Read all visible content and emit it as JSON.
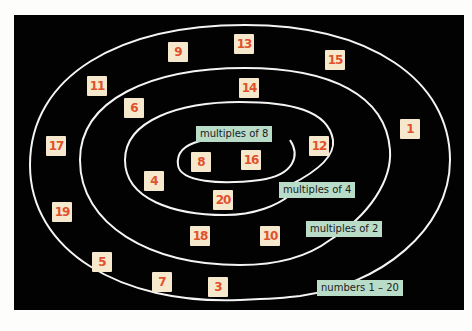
{
  "diagram": {
    "background_color": "#020202",
    "tile_color": "#f6e8cc",
    "number_color": "#e0512c",
    "label_color": "#b9dcc9",
    "sets": [
      {
        "label": "numbers 1 – 20",
        "members_exclusive": [
          "9",
          "13",
          "15",
          "11",
          "1",
          "17",
          "19",
          "5",
          "7",
          "3"
        ]
      },
      {
        "label": "multiples of 2",
        "members_exclusive": [
          "14",
          "6",
          "18",
          "10"
        ]
      },
      {
        "label": "multiples of 4",
        "members_exclusive": [
          "12",
          "4",
          "20"
        ]
      },
      {
        "label": "multiples of 8",
        "members_exclusive": [
          "8",
          "16"
        ]
      }
    ],
    "tiles": [
      {
        "n": "9",
        "x": 168,
        "y": 42
      },
      {
        "n": "13",
        "x": 234,
        "y": 34
      },
      {
        "n": "15",
        "x": 325,
        "y": 50
      },
      {
        "n": "11",
        "x": 87,
        "y": 76
      },
      {
        "n": "14",
        "x": 239,
        "y": 78
      },
      {
        "n": "6",
        "x": 124,
        "y": 98
      },
      {
        "n": "1",
        "x": 400,
        "y": 119
      },
      {
        "n": "17",
        "x": 46,
        "y": 136
      },
      {
        "n": "12",
        "x": 309,
        "y": 136
      },
      {
        "n": "8",
        "x": 191,
        "y": 152
      },
      {
        "n": "16",
        "x": 241,
        "y": 150
      },
      {
        "n": "4",
        "x": 144,
        "y": 171
      },
      {
        "n": "20",
        "x": 213,
        "y": 190
      },
      {
        "n": "19",
        "x": 52,
        "y": 202
      },
      {
        "n": "18",
        "x": 190,
        "y": 226
      },
      {
        "n": "10",
        "x": 260,
        "y": 226
      },
      {
        "n": "5",
        "x": 92,
        "y": 252
      },
      {
        "n": "7",
        "x": 152,
        "y": 272
      },
      {
        "n": "3",
        "x": 208,
        "y": 277
      }
    ],
    "labels": [
      {
        "text": "multiples of 8",
        "x": 196,
        "y": 126
      },
      {
        "text": "multiples of 4",
        "x": 279,
        "y": 182
      },
      {
        "text": "multiples of 2",
        "x": 306,
        "y": 221
      },
      {
        "text": "numbers 1 – 20",
        "x": 317,
        "y": 280
      }
    ]
  }
}
